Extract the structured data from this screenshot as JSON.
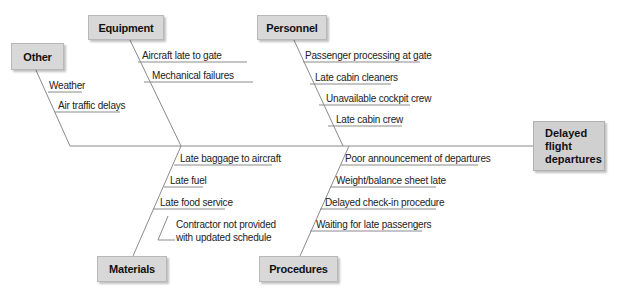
{
  "effect": {
    "lines": [
      "Delayed",
      "flight",
      "departures"
    ]
  },
  "categories": {
    "other": {
      "label": "Other",
      "causes": [
        "Weather",
        "Air traffic delays"
      ]
    },
    "equipment": {
      "label": "Equipment",
      "causes": [
        "Aircraft late to gate",
        "Mechanical failures"
      ]
    },
    "personnel": {
      "label": "Personnel",
      "causes": [
        "Passenger processing at gate",
        "Late cabin cleaners",
        "Unavailable cockpit crew",
        "Late cabin crew"
      ]
    },
    "materials": {
      "label": "Materials",
      "causes": [
        "Late baggage to aircraft",
        "Late fuel",
        "Late food service"
      ],
      "subcause": [
        "Contractor not provided",
        "with updated schedule"
      ]
    },
    "procedures": {
      "label": "Procedures",
      "causes": [
        "Poor announcement of departures",
        "Weight/balance sheet late",
        "Delayed check-in procedure",
        "Waiting for late passengers"
      ]
    }
  },
  "colors": {
    "line": "#8a8a8a",
    "box_fill": "#d8d8d8"
  }
}
